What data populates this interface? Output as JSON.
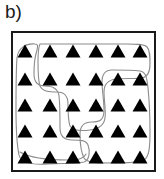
{
  "figure": {
    "panel_label": "b)",
    "caption_text": "b)",
    "background_color": "#ffffff"
  },
  "plot_box": {
    "x": 11,
    "y": 31,
    "width": 145,
    "height": 141,
    "border_color": "#1a1a1a",
    "border_width": 2,
    "fill_color": "#ffffff"
  },
  "markers": {
    "shape": "triangle",
    "fill_color": "#000000",
    "count": 30,
    "rows": 5,
    "columns": 6,
    "size": 15,
    "height": 13
  },
  "chart_data": {
    "type": "scatter",
    "title": "b)",
    "xlabel": "",
    "ylabel": "",
    "grid": false,
    "legend": "none",
    "marker_shape": "triangle",
    "marker_color": "#000000",
    "xlim": [
      0,
      6
    ],
    "ylim": [
      0,
      5
    ],
    "points": [
      {
        "x": 0,
        "y": 4,
        "cx": 25,
        "cy": 51,
        "group": 1
      },
      {
        "x": 1,
        "y": 4,
        "cx": 50,
        "cy": 51,
        "group": 2
      },
      {
        "x": 2,
        "y": 4,
        "cx": 73,
        "cy": 51,
        "group": 2
      },
      {
        "x": 3,
        "y": 4,
        "cx": 96,
        "cy": 51,
        "group": 2
      },
      {
        "x": 4,
        "y": 4,
        "cx": 118,
        "cy": 51,
        "group": 2
      },
      {
        "x": 5,
        "y": 4,
        "cx": 140,
        "cy": 51,
        "group": 2
      },
      {
        "x": 0,
        "y": 3,
        "cx": 25,
        "cy": 79,
        "group": 1
      },
      {
        "x": 1,
        "y": 3,
        "cx": 50,
        "cy": 79,
        "group": 2
      },
      {
        "x": 2,
        "y": 3,
        "cx": 73,
        "cy": 79,
        "group": 2
      },
      {
        "x": 3,
        "y": 3,
        "cx": 96,
        "cy": 79,
        "group": 2
      },
      {
        "x": 4,
        "y": 3,
        "cx": 118,
        "cy": 79,
        "group": 3
      },
      {
        "x": 5,
        "y": 3,
        "cx": 140,
        "cy": 79,
        "group": 3
      },
      {
        "x": 0,
        "y": 2,
        "cx": 25,
        "cy": 105,
        "group": 1
      },
      {
        "x": 1,
        "y": 2,
        "cx": 50,
        "cy": 105,
        "group": 1
      },
      {
        "x": 2,
        "y": 2,
        "cx": 73,
        "cy": 105,
        "group": 2
      },
      {
        "x": 3,
        "y": 2,
        "cx": 96,
        "cy": 105,
        "group": 2
      },
      {
        "x": 4,
        "y": 2,
        "cx": 118,
        "cy": 105,
        "group": 3
      },
      {
        "x": 5,
        "y": 2,
        "cx": 140,
        "cy": 105,
        "group": 3
      },
      {
        "x": 0,
        "y": 1,
        "cx": 25,
        "cy": 131,
        "group": 1
      },
      {
        "x": 1,
        "y": 1,
        "cx": 50,
        "cy": 131,
        "group": 1
      },
      {
        "x": 2,
        "y": 1,
        "cx": 73,
        "cy": 131,
        "group": 1
      },
      {
        "x": 3,
        "y": 1,
        "cx": 96,
        "cy": 131,
        "group": 3
      },
      {
        "x": 4,
        "y": 1,
        "cx": 118,
        "cy": 131,
        "group": 3
      },
      {
        "x": 5,
        "y": 1,
        "cx": 140,
        "cy": 131,
        "group": 3
      },
      {
        "x": 0,
        "y": 0,
        "cx": 25,
        "cy": 157,
        "group": 1
      },
      {
        "x": 1,
        "y": 0,
        "cx": 50,
        "cy": 157,
        "group": 1
      },
      {
        "x": 2,
        "y": 0,
        "cx": 73,
        "cy": 157,
        "group": 1
      },
      {
        "x": 3,
        "y": 0,
        "cx": 96,
        "cy": 157,
        "group": 3
      },
      {
        "x": 4,
        "y": 0,
        "cx": 118,
        "cy": 157,
        "group": 3
      },
      {
        "x": 5,
        "y": 0,
        "cx": 140,
        "cy": 157,
        "group": 3
      }
    ],
    "regions": [
      {
        "name": "region-left",
        "stroke": "#8c8c8c",
        "fill": "none",
        "path": "M 35 44 C 26 43, 18 48, 17 58 C 16 70, 16 92, 16 110 C 16 128, 17 145, 19 155 C 21 164, 34 165, 48 164 C 62 163, 76 164, 84 162 C 90 160, 90 150, 88 145 C 86 140, 80 140, 72 140 C 64 140, 60 136, 60 128 C 60 118, 60 104, 59 96 C 58 88, 52 86, 45 86 C 38 86, 34 82, 34 74 C 34 66, 35 56, 37 50 C 38 46, 38 44, 35 44 Z"
      },
      {
        "name": "region-top",
        "stroke": "#8c8c8c",
        "fill": "none",
        "path": "M 40 44 C 38 48, 38 54, 38 62 C 38 72, 38 80, 40 86 C 43 92, 50 92, 57 92 C 64 92, 68 96, 68 104 C 68 112, 68 120, 70 126 C 73 131, 82 131, 90 130 C 98 129, 104 126, 105 118 C 106 110, 104 100, 104 92 C 104 84, 108 80, 116 79 C 124 78, 134 79, 142 78 C 148 77, 150 72, 150 64 C 150 56, 150 50, 147 47 C 144 44, 136 44, 126 44 C 100 44, 62 44, 46 44 C 42 44, 41 44, 40 44 Z"
      },
      {
        "name": "region-right",
        "stroke": "#8c8c8c",
        "fill": "none",
        "path": "M 112 70 C 106 70, 102 74, 102 82 C 102 90, 104 100, 104 110 C 104 120, 100 122, 92 122 C 84 122, 80 126, 80 134 C 80 142, 81 152, 84 158 C 87 163, 98 163, 112 163 C 126 163, 138 163, 144 160 C 149 157, 150 148, 150 132 C 150 116, 149 98, 148 88 C 147 78, 146 72, 140 71 C 132 70, 120 70, 112 70 Z"
      },
      {
        "name": "region-bottom-left-tail",
        "stroke": "#8c8c8c",
        "fill": "none",
        "path": "M 20 152 C 30 158, 50 160, 68 160 C 80 160, 84 158, 86 154"
      }
    ]
  },
  "colors": {
    "marker": "#000000",
    "box_border": "#1a1a1a",
    "region_outline": "#8c8c8c",
    "label_text": "#1a1a1a",
    "background": "#ffffff"
  }
}
